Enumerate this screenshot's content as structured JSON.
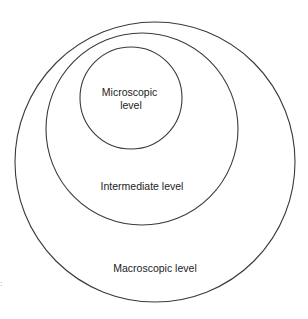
{
  "diagram": {
    "type": "nested-circles",
    "levels": [
      {
        "id": "macroscopic",
        "label_lines": [
          "Macroscopic level"
        ],
        "circle": {
          "cx": 155,
          "cy": 162,
          "r": 140
        },
        "label_pos": {
          "x": 155,
          "y": 272
        }
      },
      {
        "id": "intermediate",
        "label_lines": [
          "Intermediate level"
        ],
        "circle": {
          "cx": 142,
          "cy": 129,
          "r": 96
        },
        "label_pos": {
          "x": 142,
          "y": 190
        }
      },
      {
        "id": "microscopic",
        "label_lines": [
          "Microscopic",
          "level"
        ],
        "circle": {
          "cx": 131,
          "cy": 98,
          "r": 51
        },
        "label_pos": {
          "x": 131,
          "y": 96
        }
      }
    ],
    "stroke_color": "#3a3a3a",
    "text_color": "#222222",
    "background": "#ffffff"
  },
  "edge_artifact": ":"
}
